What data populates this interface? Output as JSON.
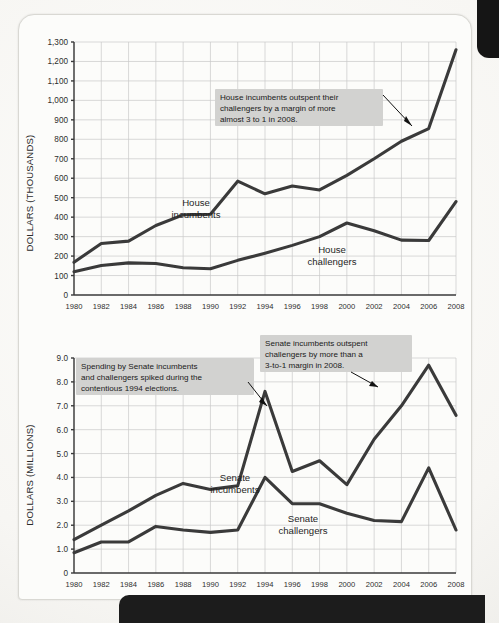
{
  "page": {
    "background_color": "#fcfcfa",
    "banner_color": "#1c1c1c"
  },
  "charts": [
    {
      "id": "house-chart",
      "ylabel": "DOLLARS (THOUSANDS)",
      "series_labels": {
        "incumbents": "House\nincumbents",
        "incumbents_line1": "House",
        "incumbents_line2": "incumbents",
        "challengers_line1": "House",
        "challengers_line2": "challengers"
      },
      "callout": {
        "line1": "House incumbents outspent their",
        "line2": "challengers by a margin of more",
        "line3": "almost 3 to 1 in 2008."
      }
    },
    {
      "id": "senate-chart",
      "ylabel": "DOLLARS (MILLIONS)",
      "series_labels": {
        "incumbents_line1": "Senate",
        "incumbents_line2": "incumbents",
        "challengers_line1": "Senate",
        "challengers_line2": "challengers"
      },
      "callout_left": {
        "line1": "Spending by Senate incumbents",
        "line2": "and challengers spiked during the",
        "line3": "contentious 1994 elections."
      },
      "callout_right": {
        "line1": "Senate incumbents outspent",
        "line2": "challengers by more than a",
        "line3": "3-to-1 margin in 2008."
      }
    }
  ],
  "chart_data": [
    {
      "type": "line",
      "title": "",
      "xlabel": "",
      "ylabel": "DOLLARS (THOUSANDS)",
      "x": [
        1980,
        1982,
        1984,
        1986,
        1988,
        1990,
        1992,
        1994,
        1996,
        1998,
        2000,
        2002,
        2004,
        2006,
        2008
      ],
      "xlim": [
        1980,
        2008
      ],
      "ylim": [
        0,
        1300
      ],
      "yticks": [
        0,
        100,
        200,
        300,
        400,
        500,
        600,
        700,
        800,
        900,
        1000,
        1100,
        1200,
        1300
      ],
      "ytick_labels": [
        "0",
        "100",
        "200",
        "300",
        "400",
        "500",
        "600",
        "700",
        "800",
        "900",
        "1,000",
        "1,100",
        "1,200",
        "1,300"
      ],
      "xtick_labels": [
        "1980",
        "1982",
        "1984",
        "1986",
        "1988",
        "1990",
        "1992",
        "1994",
        "1996",
        "1998",
        "2000",
        "2002",
        "2004",
        "2006",
        "2008"
      ],
      "grid": true,
      "legend": "inline-labels",
      "series": [
        {
          "name": "House incumbents",
          "values": [
            168,
            265,
            277,
            357,
            412,
            415,
            585,
            520,
            560,
            540,
            615,
            700,
            790,
            855,
            1260
          ]
        },
        {
          "name": "House challengers",
          "values": [
            120,
            152,
            165,
            162,
            140,
            135,
            178,
            215,
            255,
            300,
            370,
            330,
            282,
            280,
            480
          ]
        }
      ],
      "annotations": [
        {
          "text": "House incumbents outspent their challengers by a margin of more almost 3 to 1 in 2008.",
          "points_to_year": 2006
        }
      ]
    },
    {
      "type": "line",
      "title": "",
      "xlabel": "",
      "ylabel": "DOLLARS (MILLIONS)",
      "x": [
        1980,
        1982,
        1984,
        1986,
        1988,
        1990,
        1992,
        1994,
        1996,
        1998,
        2000,
        2002,
        2004,
        2006,
        2008
      ],
      "xlim": [
        1980,
        2008
      ],
      "ylim": [
        0,
        9.0
      ],
      "yticks": [
        0,
        1.0,
        2.0,
        3.0,
        4.0,
        5.0,
        6.0,
        7.0,
        8.0,
        9.0
      ],
      "ytick_labels": [
        "0",
        "1.0",
        "2.0",
        "3.0",
        "4.0",
        "5.0",
        "6.0",
        "7.0",
        "8.0",
        "9.0"
      ],
      "xtick_labels": [
        "1980",
        "1982",
        "1984",
        "1986",
        "1988",
        "1990",
        "1992",
        "1994",
        "1996",
        "1998",
        "2000",
        "2002",
        "2004",
        "2006",
        "2008"
      ],
      "grid": true,
      "legend": "inline-labels",
      "series": [
        {
          "name": "Senate incumbents",
          "values": [
            1.4,
            2.0,
            2.6,
            3.25,
            3.75,
            3.5,
            3.65,
            7.6,
            4.25,
            4.7,
            3.7,
            5.6,
            7.0,
            8.7,
            6.6
          ]
        },
        {
          "name": "Senate challengers",
          "values": [
            0.85,
            1.3,
            1.3,
            1.95,
            1.8,
            1.7,
            1.8,
            4.0,
            2.9,
            2.9,
            2.5,
            2.2,
            2.15,
            4.4,
            1.8
          ]
        }
      ],
      "annotations": [
        {
          "text": "Spending by Senate incumbents and challengers spiked during the contentious 1994 elections.",
          "points_to_year": 1994
        },
        {
          "text": "Senate incumbents outspent challengers by more than a 3-to-1 margin in 2008.",
          "points_to_year": 2006
        }
      ]
    }
  ]
}
